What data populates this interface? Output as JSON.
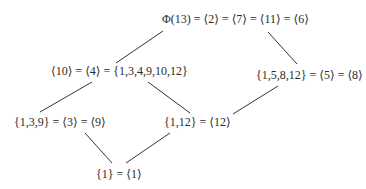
{
  "diagram": {
    "type": "subgroup-lattice",
    "nodes": {
      "top": "Φ(13) = ⟨2⟩ = ⟨7⟩ = ⟨11⟩ = ⟨6⟩",
      "order6": "⟨10⟩ = ⟨4⟩ = {1,3,4,9,10,12}",
      "order4": "{1,5,8,12} = ⟨5⟩ = ⟨8⟩",
      "order3": "{1,3,9} = ⟨3⟩ = ⟨9⟩",
      "order2": "{1,12} = ⟨12⟩",
      "bottom": "{1} = ⟨1⟩"
    },
    "edges": [
      {
        "from": "top",
        "to": "order6"
      },
      {
        "from": "top",
        "to": "order4"
      },
      {
        "from": "order6",
        "to": "order3"
      },
      {
        "from": "order6",
        "to": "order2"
      },
      {
        "from": "order4",
        "to": "order2"
      },
      {
        "from": "order3",
        "to": "bottom"
      },
      {
        "from": "order2",
        "to": "bottom"
      }
    ],
    "line_color": "#333333",
    "text_color": "#2a2a2a"
  }
}
